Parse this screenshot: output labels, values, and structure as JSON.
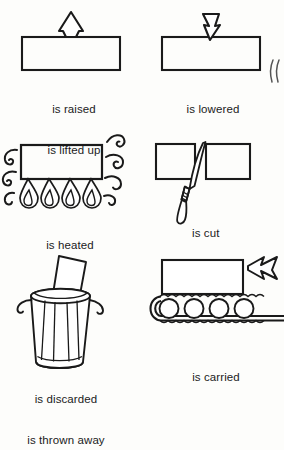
{
  "page": {
    "background_color": "#fdfdfb",
    "ink_color": "#1a1a1a",
    "width": 284,
    "height": 402
  },
  "panels": [
    {
      "id": "raised",
      "icon": "block-with-up-arrow-icon",
      "captions": [
        "is raised",
        "is lifted up"
      ]
    },
    {
      "id": "lowered",
      "icon": "block-with-down-arrow-icon",
      "captions": [
        "is lowered"
      ]
    },
    {
      "id": "heated",
      "icon": "block-over-flames-icon",
      "captions": [
        "is heated"
      ]
    },
    {
      "id": "cut",
      "icon": "knife-splitting-block-icon",
      "captions": [
        "is cut"
      ]
    },
    {
      "id": "discarded",
      "icon": "trash-can-icon",
      "captions": [
        "is discarded",
        "is thrown away"
      ]
    },
    {
      "id": "carried",
      "icon": "conveyor-belt-icon",
      "captions": [
        "is carried"
      ]
    }
  ],
  "marks": {
    "edge_glyph": "stray-parenthesis-mark"
  }
}
